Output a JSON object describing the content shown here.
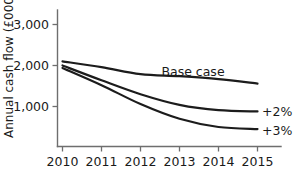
{
  "chart_data": {
    "type": "line",
    "title": "",
    "xlabel": "",
    "ylabel": "Annual cash flow (£000)",
    "categories": [
      "2010",
      "2011",
      "2012",
      "2013",
      "2014",
      "2015"
    ],
    "x": [
      2010,
      2011,
      2012,
      2013,
      2014,
      2015
    ],
    "xlim": [
      2010,
      2015
    ],
    "ylim": [
      0,
      3000
    ],
    "yticks": [
      1000,
      2000,
      3000
    ],
    "ytick_labels": [
      "1,000",
      "2,000",
      "3,000"
    ],
    "grid": false,
    "legend_position": "inline-right",
    "series": [
      {
        "name": "Base case",
        "label": "Base case",
        "values": [
          2100,
          1960,
          1790,
          1740,
          1670,
          1560
        ]
      },
      {
        "name": "+2%",
        "label": "+2%",
        "values": [
          2000,
          1640,
          1300,
          1040,
          910,
          880
        ]
      },
      {
        "name": "+3%",
        "label": "+3%",
        "values": [
          1940,
          1520,
          1060,
          700,
          500,
          450
        ]
      }
    ]
  },
  "axis": {
    "y_title": "Annual cash flow (£000)",
    "y_labels": [
      "3,000",
      "2,000",
      "1,000"
    ],
    "x_labels": [
      "2010",
      "2011",
      "2012",
      "2013",
      "2014",
      "2015"
    ]
  },
  "annotations": {
    "base_case": "Base case",
    "plus_two": "+2%",
    "plus_three": "+3%"
  }
}
